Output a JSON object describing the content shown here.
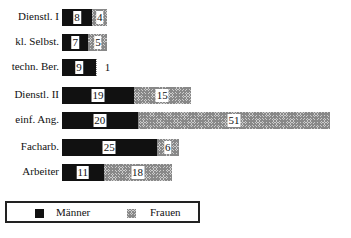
{
  "chart_data": {
    "type": "bar",
    "orientation": "horizontal",
    "stacked": true,
    "title": "",
    "xlabel": "",
    "ylabel": "",
    "grid": false,
    "legend_position": "bottom-left, boxed",
    "categories": [
      "Dienstl. I",
      "kl. Selbst.",
      "techn. Ber.",
      "Dienstl. II",
      "einf. Ang.",
      "Facharb.",
      "Arbeiter"
    ],
    "series": [
      {
        "name": "Männer",
        "color": "#111111",
        "values": [
          8,
          7,
          9,
          19,
          20,
          25,
          11
        ]
      },
      {
        "name": "Frauen",
        "color": "#bbbbbb",
        "pattern": "crosshatch",
        "values": [
          4,
          5,
          1,
          15,
          51,
          6,
          18
        ]
      }
    ]
  },
  "legend": {
    "men": "Männer",
    "women": "Frauen"
  }
}
